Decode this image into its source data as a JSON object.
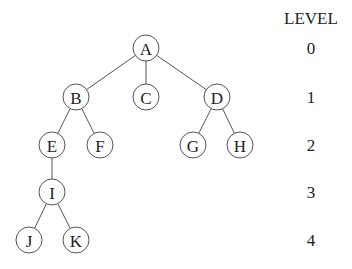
{
  "diagram": {
    "type": "tree",
    "level_header": "LEVEL",
    "levels": [
      "0",
      "1",
      "2",
      "3",
      "4"
    ],
    "nodes": [
      {
        "id": "A",
        "label": "A",
        "level": 0,
        "x": 146,
        "y": 48
      },
      {
        "id": "B",
        "label": "B",
        "level": 1,
        "x": 76,
        "y": 97
      },
      {
        "id": "C",
        "label": "C",
        "level": 1,
        "x": 146,
        "y": 97
      },
      {
        "id": "D",
        "label": "D",
        "level": 1,
        "x": 217,
        "y": 97
      },
      {
        "id": "E",
        "label": "E",
        "level": 2,
        "x": 52,
        "y": 145
      },
      {
        "id": "F",
        "label": "F",
        "level": 2,
        "x": 100,
        "y": 145
      },
      {
        "id": "G",
        "label": "G",
        "level": 2,
        "x": 193,
        "y": 145
      },
      {
        "id": "H",
        "label": "H",
        "level": 2,
        "x": 240,
        "y": 145
      },
      {
        "id": "I",
        "label": "I",
        "level": 3,
        "x": 52,
        "y": 192
      },
      {
        "id": "J",
        "label": "J",
        "level": 4,
        "x": 29,
        "y": 240
      },
      {
        "id": "K",
        "label": "K",
        "level": 4,
        "x": 76,
        "y": 240
      }
    ],
    "edges": [
      [
        "A",
        "B"
      ],
      [
        "A",
        "C"
      ],
      [
        "A",
        "D"
      ],
      [
        "B",
        "E"
      ],
      [
        "B",
        "F"
      ],
      [
        "D",
        "G"
      ],
      [
        "D",
        "H"
      ],
      [
        "E",
        "I"
      ],
      [
        "I",
        "J"
      ],
      [
        "I",
        "K"
      ]
    ],
    "level_label_x": 311,
    "level_y": [
      48,
      97,
      145,
      192,
      240
    ],
    "node_radius": 13
  }
}
